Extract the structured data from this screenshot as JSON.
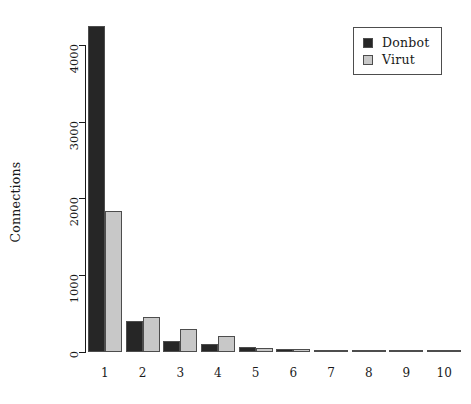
{
  "chart_data": {
    "type": "bar",
    "title": "",
    "subtitle": "",
    "xlabel": "",
    "ylabel": "Connections",
    "categories": [
      "1",
      "2",
      "3",
      "4",
      "5",
      "6",
      "7",
      "8",
      "9",
      "10"
    ],
    "series": [
      {
        "name": "Donbot",
        "color": "#262626",
        "values": [
          4250,
          400,
          145,
          105,
          70,
          40,
          25,
          15,
          12,
          10
        ]
      },
      {
        "name": "Virut",
        "color": "#c8c8c8",
        "values": [
          1830,
          450,
          300,
          210,
          55,
          45,
          22,
          14,
          10,
          10
        ]
      }
    ],
    "ylim": [
      0,
      4400
    ],
    "yticks": [
      0,
      1000,
      2000,
      3000,
      4000
    ],
    "ytick_labels": [
      "0",
      "1000",
      "2000",
      "3000",
      "4000"
    ],
    "xticks": [
      "1",
      "2",
      "3",
      "4",
      "5",
      "6",
      "7",
      "8",
      "9",
      "10"
    ],
    "grid": false,
    "legend_position": "top-right",
    "legend_entries": [
      {
        "label": "Donbot",
        "color": "#262626"
      },
      {
        "label": "Virut",
        "color": "#c8c8c8"
      }
    ],
    "bar_border_color": "#4d4d4d",
    "axis_color": "#1a1a1a",
    "background": "#ffffff"
  }
}
